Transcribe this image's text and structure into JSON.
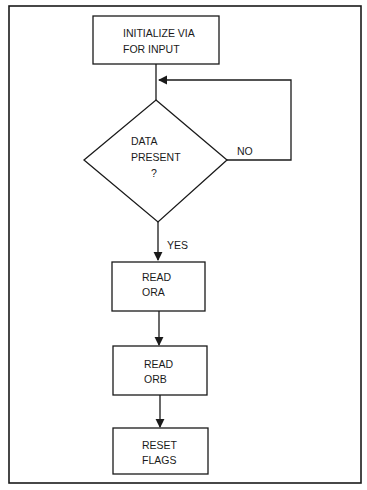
{
  "diagram": {
    "type": "flowchart",
    "nodes": [
      {
        "id": "init",
        "shape": "process",
        "lines": [
          "INITIALIZE VIA",
          "FOR INPUT"
        ]
      },
      {
        "id": "decision",
        "shape": "decision",
        "lines": [
          "DATA",
          "PRESENT",
          "?"
        ]
      },
      {
        "id": "read_ora",
        "shape": "process",
        "lines": [
          "READ",
          "ORA"
        ]
      },
      {
        "id": "read_orb",
        "shape": "process",
        "lines": [
          "READ",
          "ORB"
        ]
      },
      {
        "id": "reset_flags",
        "shape": "process",
        "lines": [
          "RESET",
          "FLAGS"
        ]
      }
    ],
    "edges": [
      {
        "from": "init",
        "to": "decision",
        "label": ""
      },
      {
        "from": "decision",
        "to": "decision",
        "label": "NO"
      },
      {
        "from": "decision",
        "to": "read_ora",
        "label": "YES"
      },
      {
        "from": "read_ora",
        "to": "read_orb",
        "label": ""
      },
      {
        "from": "read_orb",
        "to": "reset_flags",
        "label": ""
      }
    ],
    "labels": {
      "no": "NO",
      "yes": "YES"
    },
    "colors": {
      "stroke": "#1a1a1a",
      "background": "#ffffff"
    }
  }
}
